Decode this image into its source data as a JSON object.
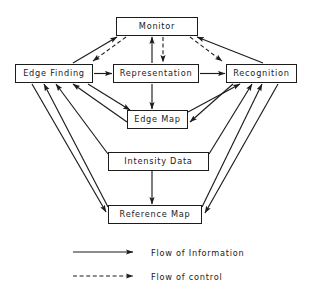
{
  "diagram": {
    "type": "flow-diagram",
    "background_color": "#ffffff",
    "line_color": "#1c1c1c",
    "nodes": [
      {
        "id": "monitor",
        "label": "Monitor",
        "x": 116,
        "y": 17,
        "w": 82,
        "h": 19
      },
      {
        "id": "edge-finding",
        "label": "Edge  Finding",
        "x": 15,
        "y": 64,
        "w": 78,
        "h": 19
      },
      {
        "id": "representation",
        "label": "Representation",
        "x": 113,
        "y": 64,
        "w": 86,
        "h": 19
      },
      {
        "id": "recognition",
        "label": "Recognition",
        "x": 226,
        "y": 64,
        "w": 71,
        "h": 19
      },
      {
        "id": "edge-map",
        "label": "Edge  Map",
        "x": 127,
        "y": 110,
        "w": 61,
        "h": 19
      },
      {
        "id": "intensity-data",
        "label": "Intensity  Data",
        "x": 108,
        "y": 152,
        "w": 101,
        "h": 19
      },
      {
        "id": "reference-map",
        "label": "Reference  Map",
        "x": 108,
        "y": 205,
        "w": 94,
        "h": 19
      }
    ],
    "edges": [
      {
        "id": "edge-finding-to-monitor",
        "from": "edge-finding",
        "to": "monitor",
        "style": "solid"
      },
      {
        "id": "monitor-to-edge-finding",
        "from": "monitor",
        "to": "edge-finding",
        "style": "dashed"
      },
      {
        "id": "recognition-to-monitor",
        "from": "recognition",
        "to": "monitor",
        "style": "solid"
      },
      {
        "id": "monitor-to-recognition",
        "from": "monitor",
        "to": "recognition",
        "style": "dashed"
      },
      {
        "id": "representation-to-monitor",
        "from": "representation",
        "to": "monitor",
        "style": "solid"
      },
      {
        "id": "monitor-to-representation",
        "from": "monitor",
        "to": "representation",
        "style": "dashed"
      },
      {
        "id": "edge-finding-to-representation",
        "from": "edge-finding",
        "to": "representation",
        "style": "solid"
      },
      {
        "id": "representation-to-recognition",
        "from": "representation",
        "to": "recognition",
        "style": "solid"
      },
      {
        "id": "representation-to-edge-map",
        "from": "representation",
        "to": "edge-map",
        "style": "solid"
      },
      {
        "id": "edge-finding-to-edge-map",
        "from": "edge-finding",
        "to": "edge-map",
        "style": "solid"
      },
      {
        "id": "edge-map-to-edge-finding",
        "from": "edge-map",
        "to": "edge-finding",
        "style": "solid"
      },
      {
        "id": "edge-map-to-recognition",
        "from": "edge-map",
        "to": "recognition",
        "style": "solid"
      },
      {
        "id": "recognition-to-edge-map",
        "from": "recognition",
        "to": "edge-map",
        "style": "solid"
      },
      {
        "id": "intensity-data-to-reference-map",
        "from": "intensity-data",
        "to": "reference-map",
        "style": "solid"
      },
      {
        "id": "intensity-data-to-edge-finding",
        "from": "intensity-data",
        "to": "edge-finding",
        "style": "solid"
      },
      {
        "id": "intensity-data-to-recognition",
        "from": "intensity-data",
        "to": "recognition",
        "style": "solid"
      },
      {
        "id": "reference-map-to-edge-finding",
        "from": "reference-map",
        "to": "edge-finding",
        "style": "solid"
      },
      {
        "id": "reference-map-to-recognition",
        "from": "reference-map",
        "to": "recognition",
        "style": "solid"
      },
      {
        "id": "recognition-to-reference-map",
        "from": "recognition",
        "to": "reference-map",
        "style": "solid"
      },
      {
        "id": "edge-finding-to-reference-map",
        "from": "edge-finding",
        "to": "reference-map",
        "style": "solid"
      }
    ]
  },
  "legend": {
    "items": [
      {
        "id": "flow-of-information",
        "label": "Flow  of  Information",
        "style": "solid"
      },
      {
        "id": "flow-of-control",
        "label": "Flow  of  control",
        "style": "dashed"
      }
    ]
  }
}
